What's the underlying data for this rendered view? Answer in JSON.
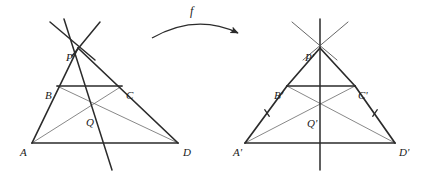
{
  "figure": {
    "background_color": "#ffffff",
    "stroke_color": "#2b2b2b",
    "thin_stroke_color": "#555555",
    "width": 429,
    "height": 177,
    "map_label": "f",
    "left_figure": {
      "name": "pre-image",
      "labels": {
        "A": "A",
        "B": "B",
        "C": "C",
        "D": "D",
        "P": "P",
        "Q": "Q"
      },
      "points": {
        "A": [
          32,
          143
        ],
        "B": [
          57,
          86
        ],
        "C": [
          122,
          86
        ],
        "D": [
          178,
          143
        ],
        "P": [
          78,
          48
        ],
        "Q": [
          93,
          103
        ]
      },
      "label_positions": {
        "A": [
          20,
          147
        ],
        "B": [
          45,
          90
        ],
        "C": [
          126,
          90
        ],
        "D": [
          183,
          147
        ],
        "P": [
          66,
          52
        ],
        "Q": [
          86,
          117
        ]
      },
      "thick_segments": [
        [
          "A",
          "P"
        ],
        [
          "P",
          "D"
        ],
        [
          "A",
          "D"
        ],
        [
          "B",
          "C"
        ]
      ],
      "thin_segments": [
        [
          "A",
          "C"
        ],
        [
          "B",
          "D"
        ]
      ],
      "extra_lines": [
        {
          "name": "line-through-P-and-Q",
          "from": [
            64,
            19
          ],
          "to": [
            112,
            170
          ],
          "weight": "thick"
        },
        {
          "name": "ray-through-P-upper-left",
          "from": [
            50,
            22
          ],
          "to": [
            95,
            60
          ],
          "weight": "thick"
        },
        {
          "name": "ray-through-P-upper-right",
          "from": [
            100,
            22
          ],
          "to": [
            72,
            56
          ],
          "weight": "thick"
        }
      ],
      "tick_marks": []
    },
    "right_figure": {
      "name": "image",
      "labels": {
        "A": "A'",
        "B": "B'",
        "C": "C'",
        "D": "D'",
        "P": "P'",
        "Q": "Q'"
      },
      "points": {
        "A": [
          245,
          143
        ],
        "B": [
          287,
          86
        ],
        "C": [
          355,
          86
        ],
        "D": [
          395,
          143
        ],
        "P": [
          320,
          48
        ],
        "Q": [
          320,
          103
        ]
      },
      "label_positions": {
        "A": [
          233,
          147
        ],
        "B": [
          274,
          90
        ],
        "C": [
          358,
          90
        ],
        "D": [
          399,
          147
        ],
        "P": [
          305,
          52
        ],
        "Q": [
          307,
          118
        ]
      },
      "thick_segments": [
        [
          "A",
          "B"
        ],
        [
          "B",
          "P"
        ],
        [
          "P",
          "C"
        ],
        [
          "C",
          "D"
        ],
        [
          "A",
          "D"
        ],
        [
          "B",
          "C"
        ]
      ],
      "thin_segments": [
        [
          "A",
          "C"
        ],
        [
          "B",
          "D"
        ]
      ],
      "extra_lines": [
        {
          "name": "vertical-axis-of-symmetry",
          "from": [
            320,
            19
          ],
          "to": [
            320,
            170
          ],
          "weight": "thick"
        },
        {
          "name": "ray-through-P-upper-left",
          "from": [
            292,
            22
          ],
          "to": [
            337,
            60
          ],
          "weight": "thin"
        },
        {
          "name": "ray-through-P-upper-right",
          "from": [
            348,
            22
          ],
          "to": [
            303,
            60
          ],
          "weight": "thin"
        }
      ],
      "tick_marks": [
        {
          "name": "tick-on-AB",
          "center": [
            267,
            113
          ],
          "angle_deg": 125
        },
        {
          "name": "tick-on-CD",
          "center": [
            375,
            113
          ],
          "angle_deg": 55
        }
      ]
    },
    "map_arrow": {
      "name": "f-arrow",
      "start": [
        152,
        38
      ],
      "control": [
        196,
        13
      ],
      "end": [
        238,
        33
      ],
      "label_position": [
        190,
        5
      ]
    }
  }
}
